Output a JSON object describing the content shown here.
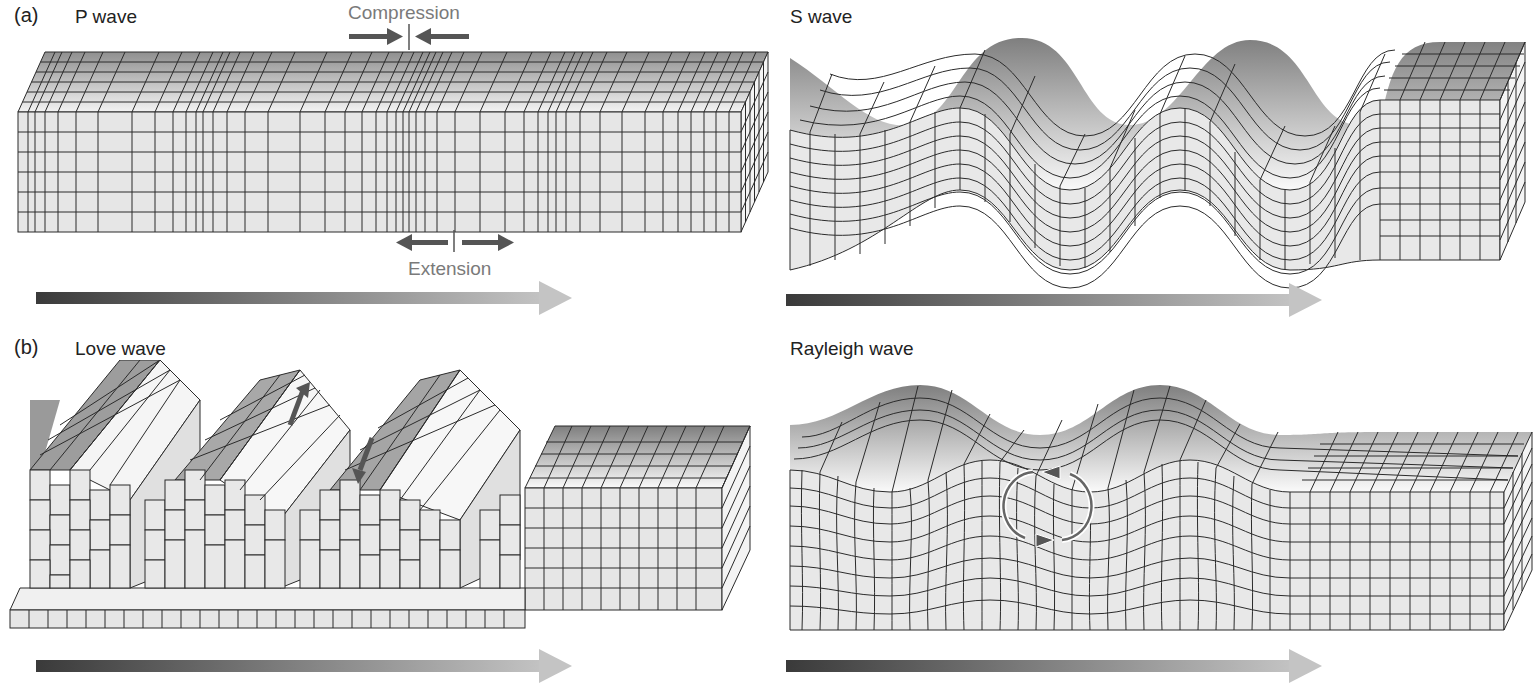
{
  "figure": {
    "panels": [
      {
        "id": "a",
        "letter": "(a)",
        "title": "P wave",
        "annotations": {
          "compression": "Compression",
          "extension": "Extension"
        }
      },
      {
        "id": "s",
        "title": "S wave"
      },
      {
        "id": "b",
        "letter": "(b)",
        "title": "Love wave"
      },
      {
        "id": "r",
        "title": "Rayleigh wave"
      }
    ],
    "icons": {
      "direction_arrow": "propagation-arrow",
      "compression_arrows": "inward-arrows",
      "extension_arrows": "outward-arrows",
      "love_motion_arrows": "transverse-arrows",
      "rayleigh_motion": "elliptical-rotation"
    },
    "colors": {
      "grid_line": "#2b2b2b",
      "front_face": "#e6e6e6",
      "side_face": "#f4f4f4",
      "top_dark": "#8c8c8c",
      "top_light": "#f2f2f2",
      "arrow_dark": "#3a3a3a",
      "arrow_light": "#bdbdbd",
      "annotation_text": "#7a7a7a"
    }
  }
}
